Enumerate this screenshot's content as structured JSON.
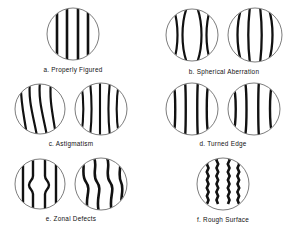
{
  "figure": {
    "background_color": "#ffffff",
    "line_color": "#111111",
    "circle_outline_color": "#333333",
    "caption_color": "#111111"
  },
  "panels": [
    {
      "key": "a",
      "letter": "a.",
      "name": "Properly Figured",
      "caption": "a.  Properly Figured",
      "disc_count": 1,
      "discs": [
        {
          "pattern": "straight-vertical-bands",
          "radius": 26,
          "band_count": 4,
          "band_offsets": [
            -16,
            -6,
            5,
            15
          ],
          "band_width": 2.6,
          "description": "Evenly spaced perfectly straight vertical bands"
        }
      ]
    },
    {
      "key": "b",
      "letter": "b.",
      "name": "Spherical Aberration",
      "caption": "b.  Spherical Aberration",
      "disc_count": 2,
      "discs": [
        {
          "pattern": "pinched-waist-bands",
          "radius": 26,
          "band_count": 4,
          "band_offsets": [
            -17,
            -6,
            6,
            17
          ],
          "band_width": 2.2,
          "bulge": 7,
          "description": "Bands bow toward the optical axis forming a pinched waist"
        },
        {
          "pattern": "barrel-bulge-bands",
          "radius": 27,
          "band_count": 4,
          "band_offsets": [
            -17,
            -6,
            6,
            17
          ],
          "band_width": 2.2,
          "bulge": -6,
          "description": "Bands bow outward in a barrel shape"
        }
      ]
    },
    {
      "key": "c",
      "letter": "c.",
      "name": "Astigmatism",
      "caption": "c.  Astigmatism",
      "disc_count": 2,
      "discs": [
        {
          "pattern": "s-skewed-bands",
          "radius": 25,
          "band_count": 4,
          "band_offsets": [
            -16,
            -6,
            5,
            15
          ],
          "band_width": 2.2,
          "skew": 6,
          "description": "Bands skew diagonally and wander, S-shaped"
        },
        {
          "pattern": "flared-bands",
          "radius": 26,
          "band_count": 5,
          "band_offsets": [
            -18,
            -9,
            0,
            9,
            18
          ],
          "band_width": 2.2,
          "flare": 5,
          "description": "Bands splay apart at top and bottom"
        }
      ]
    },
    {
      "key": "d",
      "letter": "d.",
      "name": "Turned Edge",
      "caption": "d.  Turned Edge",
      "disc_count": 2,
      "discs": [
        {
          "pattern": "edge-hook-bands",
          "radius": 26,
          "band_count": 4,
          "band_offsets": [
            -16,
            -6,
            6,
            16
          ],
          "band_width": 2.4,
          "hook": 3,
          "description": "Straight bands that hook outward only near the rim"
        },
        {
          "pattern": "edge-hook-bands-strong",
          "radius": 26,
          "band_count": 4,
          "band_offsets": [
            -18,
            -7,
            5,
            17
          ],
          "band_width": 2.4,
          "hook": 5,
          "description": "Outer bands curl sharply at the turned-down edge"
        }
      ]
    },
    {
      "key": "e",
      "letter": "e.",
      "name": "Zonal Defects",
      "caption": "e.  Zonal Defects",
      "disc_count": 2,
      "discs": [
        {
          "pattern": "zone-kink-bands",
          "radius": 25,
          "band_count": 4,
          "band_offsets": [
            -16,
            -6,
            5,
            15
          ],
          "band_width": 2.4,
          "kink": 4,
          "description": "Bands step sideways across a narrow mid zone"
        },
        {
          "pattern": "serpentine-bands",
          "radius": 26,
          "band_count": 4,
          "band_offsets": [
            -17,
            -6,
            6,
            17
          ],
          "band_width": 2.6,
          "wave_amplitude": 6,
          "description": "Strongly serpentine bands from multiple zones"
        }
      ]
    },
    {
      "key": "f",
      "letter": "f.",
      "name": "Rough Surface",
      "caption": "f.  Rough Surface",
      "disc_count": 1,
      "discs": [
        {
          "pattern": "ragged-bands",
          "radius": 26,
          "band_count": 4,
          "band_offsets": [
            -15,
            -5,
            5,
            15
          ],
          "band_width": 2.6,
          "roughness": 1.6,
          "description": "Bands with fine ragged saw-tooth edges"
        }
      ]
    }
  ]
}
